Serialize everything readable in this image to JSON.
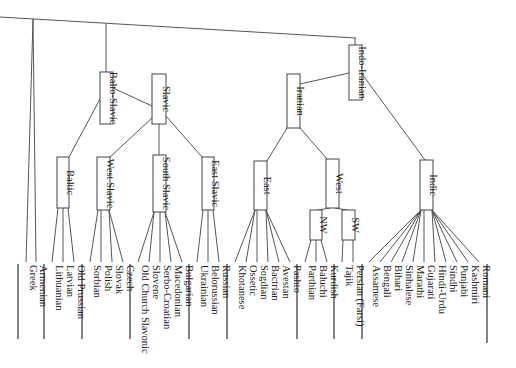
{
  "diagram": {
    "type": "language-family-tree",
    "orientation": "rotated-90",
    "root_line": {
      "x1": 0,
      "y1": 17,
      "x2": 356,
      "y2": 38
    },
    "nodes": [
      {
        "id": "balto-slavic",
        "label": "Balto-Slavic",
        "x": 100,
        "y": 72,
        "w": 13,
        "h": 52
      },
      {
        "id": "slavic",
        "label": "Slavic",
        "x": 152,
        "y": 74,
        "w": 14,
        "h": 50
      },
      {
        "id": "baltic",
        "label": "Baltic",
        "x": 57,
        "y": 157,
        "w": 12,
        "h": 51
      },
      {
        "id": "west-slavic",
        "label": "West Slavic",
        "x": 97,
        "y": 157,
        "w": 13,
        "h": 53
      },
      {
        "id": "south-slavic",
        "label": "South Slavic",
        "x": 153,
        "y": 155,
        "w": 13,
        "h": 57
      },
      {
        "id": "east-slavic",
        "label": "East Slavic",
        "x": 202,
        "y": 157,
        "w": 12,
        "h": 53
      },
      {
        "id": "indo-iranian",
        "label": "Indo-Iranian",
        "x": 349,
        "y": 45,
        "w": 13,
        "h": 55
      },
      {
        "id": "iranian",
        "label": "Iranian",
        "x": 287,
        "y": 74,
        "w": 13,
        "h": 54
      },
      {
        "id": "east-iranian",
        "label": "East",
        "x": 254,
        "y": 161,
        "w": 13,
        "h": 49
      },
      {
        "id": "west-iranian",
        "label": "West",
        "x": 326,
        "y": 159,
        "w": 13,
        "h": 49
      },
      {
        "id": "nw-iranian",
        "label": "NW",
        "x": 310,
        "y": 210,
        "w": 12,
        "h": 30
      },
      {
        "id": "sw-iranian",
        "label": "SW",
        "x": 342,
        "y": 210,
        "w": 13,
        "h": 30
      },
      {
        "id": "indic",
        "label": "Indic",
        "x": 420,
        "y": 160,
        "w": 13,
        "h": 50
      }
    ],
    "groups": [
      {
        "parent": "root",
        "bar": {
          "x": 18,
          "y1": 264,
          "y2": 339
        },
        "leaves": [
          {
            "label": "Greek",
            "x": 26
          },
          {
            "label": "Armenian",
            "x": 36
          }
        ]
      },
      {
        "parent": "baltic",
        "bar": {
          "x": 44,
          "y1": 264,
          "y2": 339
        },
        "leaves": [
          {
            "label": "Lithuanian",
            "x": 52
          },
          {
            "label": "Latvian",
            "x": 63
          },
          {
            "label": "Old Prussian",
            "x": 74
          }
        ]
      },
      {
        "parent": "west-slavic",
        "bar": {
          "x": 82,
          "y1": 264,
          "y2": 339
        },
        "leaves": [
          {
            "label": "Sorbian",
            "x": 90
          },
          {
            "label": "Polish",
            "x": 101
          },
          {
            "label": "Slovak",
            "x": 112
          },
          {
            "label": "Czech",
            "x": 123
          }
        ]
      },
      {
        "parent": "south-slavic",
        "bar": {
          "x": 130,
          "y1": 264,
          "y2": 339
        },
        "leaves": [
          {
            "label": "Old Church Slavonic",
            "x": 138
          },
          {
            "label": "Slovene",
            "x": 149
          },
          {
            "label": "Serbo-Croatian",
            "x": 160
          },
          {
            "label": "Macedonian",
            "x": 171
          },
          {
            "label": "Bulgarian",
            "x": 182
          }
        ]
      },
      {
        "parent": "east-slavic",
        "bar": {
          "x": 189,
          "y1": 264,
          "y2": 339
        },
        "leaves": [
          {
            "label": "Ukrainian",
            "x": 197
          },
          {
            "label": "Belorussian",
            "x": 208
          },
          {
            "label": "Russian",
            "x": 219
          }
        ]
      },
      {
        "parent": "east-iranian",
        "bar": {
          "x": 227,
          "y1": 264,
          "y2": 339
        },
        "leaves": [
          {
            "label": "Khotanese",
            "x": 235
          },
          {
            "label": "Ossetic",
            "x": 246
          },
          {
            "label": "Sogdian",
            "x": 257
          },
          {
            "label": "Bactrian",
            "x": 268
          },
          {
            "label": "Avestan",
            "x": 279
          },
          {
            "label": "Pashto",
            "x": 290
          }
        ]
      },
      {
        "parent": "nw-iranian",
        "bar": {
          "x": 297,
          "y1": 264,
          "y2": 339
        },
        "leaves": [
          {
            "label": "Parthian",
            "x": 305
          },
          {
            "label": "Baluchi",
            "x": 316
          },
          {
            "label": "Kurdish",
            "x": 327
          }
        ]
      },
      {
        "parent": "sw-iranian",
        "bar": {
          "x": 334,
          "y1": 264,
          "y2": 339
        },
        "leaves": [
          {
            "label": "Tajik",
            "x": 342
          },
          {
            "label": "Persian (Farsi)",
            "x": 353
          }
        ]
      },
      {
        "parent": "indic",
        "bar": {
          "x": 362,
          "y1": 264,
          "y2": 339
        },
        "leaves": [
          {
            "label": "Assamese",
            "x": 369
          },
          {
            "label": "Bengali",
            "x": 380
          },
          {
            "label": "Bihari",
            "x": 391
          },
          {
            "label": "Sinhalese",
            "x": 402
          },
          {
            "label": "Marathi",
            "x": 413
          },
          {
            "label": "Gujarati",
            "x": 424
          },
          {
            "label": "Hindi-Urdu",
            "x": 435
          },
          {
            "label": "Sindhi",
            "x": 446
          },
          {
            "label": "Punjabi",
            "x": 457
          },
          {
            "label": "Kashmiri",
            "x": 468
          },
          {
            "label": "Romani",
            "x": 479
          }
        ]
      }
    ],
    "tail_bar": {
      "x": 487,
      "y1": 264,
      "y2": 343
    },
    "edges": [
      {
        "x1": 33,
        "y1": 19,
        "x2": 26,
        "y2": 262
      },
      {
        "x1": 33,
        "y1": 19,
        "x2": 36,
        "y2": 262
      },
      {
        "x1": 106,
        "y1": 24,
        "x2": 106,
        "y2": 72
      },
      {
        "x1": 355,
        "y1": 38,
        "x2": 355,
        "y2": 45
      },
      {
        "x1": 113,
        "y1": 88,
        "x2": 152,
        "y2": 106
      },
      {
        "x1": 100,
        "y1": 99,
        "x2": 69,
        "y2": 157
      },
      {
        "x1": 152,
        "y1": 118,
        "x2": 110,
        "y2": 157
      },
      {
        "x1": 159,
        "y1": 124,
        "x2": 159,
        "y2": 155
      },
      {
        "x1": 166,
        "y1": 116,
        "x2": 202,
        "y2": 157
      },
      {
        "x1": 349,
        "y1": 73,
        "x2": 300,
        "y2": 84
      },
      {
        "x1": 362,
        "y1": 74,
        "x2": 425,
        "y2": 160
      },
      {
        "x1": 287,
        "y1": 128,
        "x2": 267,
        "y2": 161
      },
      {
        "x1": 300,
        "y1": 128,
        "x2": 327,
        "y2": 159
      },
      {
        "x1": 330,
        "y1": 208,
        "x2": 318,
        "y2": 210
      },
      {
        "x1": 335,
        "y1": 208,
        "x2": 347,
        "y2": 210
      }
    ]
  }
}
